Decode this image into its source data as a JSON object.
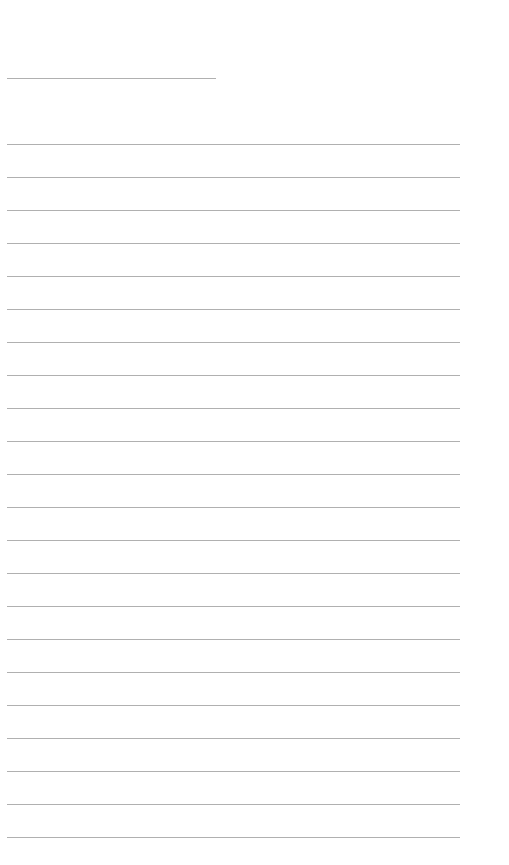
{
  "page": {
    "type": "lined-paper",
    "background": "#ffffff",
    "line_color": "#b0b0b0",
    "header_line": {
      "top": 78,
      "left": 7,
      "width": 209
    },
    "lines": {
      "count": 22,
      "first_top": 144,
      "spacing": 33,
      "left": 7,
      "width": 453
    }
  }
}
